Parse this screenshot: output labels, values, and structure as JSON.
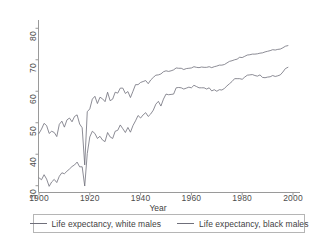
{
  "chart_data": {
    "type": "line",
    "title": "",
    "xlabel": "Year",
    "ylabel": "",
    "xlim": [
      1900,
      2000
    ],
    "ylim": [
      28,
      82
    ],
    "grid": false,
    "legend_position": "bottom",
    "xticks": [
      1900,
      1920,
      1940,
      1960,
      1980,
      2000
    ],
    "yticks": [
      30,
      40,
      50,
      60,
      70,
      80
    ],
    "x": [
      1900,
      1901,
      1902,
      1903,
      1904,
      1905,
      1906,
      1907,
      1908,
      1909,
      1910,
      1911,
      1912,
      1913,
      1914,
      1915,
      1916,
      1917,
      1918,
      1919,
      1920,
      1921,
      1922,
      1923,
      1924,
      1925,
      1926,
      1927,
      1928,
      1929,
      1930,
      1931,
      1932,
      1933,
      1934,
      1935,
      1936,
      1937,
      1938,
      1939,
      1940,
      1941,
      1942,
      1943,
      1944,
      1945,
      1946,
      1947,
      1948,
      1949,
      1950,
      1951,
      1952,
      1953,
      1954,
      1955,
      1956,
      1957,
      1958,
      1959,
      1960,
      1961,
      1962,
      1963,
      1964,
      1965,
      1966,
      1967,
      1968,
      1969,
      1970,
      1971,
      1972,
      1973,
      1974,
      1975,
      1976,
      1977,
      1978,
      1979,
      1980,
      1981,
      1982,
      1983,
      1984,
      1985,
      1986,
      1987,
      1988,
      1989,
      1990,
      1991,
      1992,
      1993,
      1994,
      1995,
      1996,
      1997,
      1998
    ],
    "series": [
      {
        "name": "Life expectancy, white males",
        "color": "#6f6f7a",
        "values": [
          46.6,
          48.0,
          49.8,
          49.1,
          46.6,
          47.3,
          46.9,
          45.6,
          49.5,
          50.5,
          48.6,
          50.9,
          51.5,
          50.3,
          52.0,
          52.5,
          49.6,
          48.4,
          36.6,
          53.5,
          54.4,
          57.5,
          58.4,
          56.1,
          58.1,
          57.6,
          56.7,
          59.7,
          57.0,
          57.5,
          59.7,
          59.4,
          61.0,
          61.0,
          59.3,
          59.9,
          58.0,
          60.0,
          62.1,
          62.1,
          62.8,
          63.1,
          63.4,
          62.4,
          63.6,
          64.4,
          65.1,
          65.2,
          65.5,
          66.2,
          66.5,
          66.3,
          66.5,
          66.8,
          67.4,
          67.3,
          67.3,
          66.9,
          67.2,
          67.3,
          67.4,
          67.8,
          67.6,
          67.5,
          67.7,
          67.6,
          67.6,
          67.8,
          67.5,
          67.8,
          68.0,
          68.3,
          68.3,
          68.5,
          69.0,
          69.5,
          69.7,
          70.0,
          70.2,
          70.8,
          70.7,
          71.1,
          71.5,
          71.6,
          71.8,
          71.8,
          71.9,
          72.1,
          72.2,
          72.5,
          72.7,
          72.9,
          73.2,
          73.1,
          73.3,
          73.4,
          73.8,
          74.3,
          74.5
        ],
        "final_value": 74.5
      },
      {
        "name": "Life expectancy, black males",
        "color": "#6f6f7a",
        "values": [
          32.5,
          31.9,
          33.5,
          32.1,
          29.8,
          31.2,
          32.0,
          31.0,
          33.0,
          34.1,
          33.8,
          34.6,
          35.3,
          36.1,
          36.6,
          37.5,
          36.0,
          36.0,
          29.9,
          40.2,
          45.5,
          47.3,
          46.6,
          45.0,
          45.7,
          44.5,
          44.0,
          46.9,
          45.5,
          45.0,
          47.3,
          47.6,
          49.3,
          48.1,
          46.9,
          48.5,
          47.0,
          49.1,
          50.6,
          52.3,
          51.5,
          52.5,
          53.2,
          52.0,
          52.8,
          54.0,
          55.9,
          56.8,
          55.3,
          57.5,
          59.1,
          58.9,
          59.0,
          59.1,
          61.1,
          61.2,
          61.1,
          60.7,
          61.0,
          61.3,
          61.1,
          61.9,
          61.5,
          61.1,
          61.1,
          61.1,
          60.7,
          61.1,
          60.1,
          60.5,
          60.0,
          60.5,
          60.4,
          60.9,
          61.7,
          62.4,
          63.1,
          64.0,
          64.0,
          64.0,
          63.8,
          64.5,
          65.1,
          65.2,
          65.3,
          65.0,
          64.8,
          65.2,
          64.4,
          64.3,
          64.5,
          64.6,
          65.0,
          64.7,
          64.9,
          65.2,
          66.1,
          67.2,
          67.6
        ],
        "final_value": 67.6
      }
    ]
  },
  "legend": {
    "entries": [
      {
        "label": "Life expectancy, white males"
      },
      {
        "label": "Life expectancy, black males"
      }
    ]
  },
  "axes": {
    "x_title": "Year",
    "x_tick_labels": [
      "1900",
      "1920",
      "1940",
      "1960",
      "1980",
      "2000"
    ],
    "y_tick_labels": [
      "30",
      "40",
      "50",
      "60",
      "70",
      "80"
    ]
  },
  "colors": {
    "line": "#6f6f7a",
    "axis": "#9a9a9a",
    "text": "#3f3f3f"
  }
}
